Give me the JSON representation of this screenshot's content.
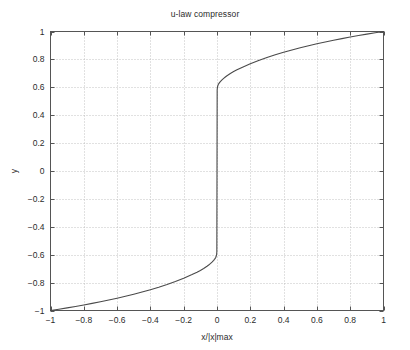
{
  "chart_data": {
    "type": "line",
    "title": "u-law compressor",
    "xlabel": "x/|x|max",
    "ylabel": "y",
    "xlim": [
      -1,
      1
    ],
    "ylim": [
      -1,
      1
    ],
    "grid": true,
    "legend": false,
    "mu": 255,
    "formula": "y = sign(x) * ln(1 + mu*|x|) / ln(1 + mu)",
    "line_color": "#4a4a4a",
    "grid_color": "#b4b4b4",
    "axis_color": "#555555",
    "background": "#ffffff",
    "xticks": [
      -1,
      -0.8,
      -0.6,
      -0.4,
      -0.2,
      0,
      0.2,
      0.4,
      0.6,
      0.8,
      1
    ],
    "xticklabels": [
      "-1",
      "-0.8",
      "-0.6",
      "-0.4",
      "-0.2",
      "0",
      "0.2",
      "0.4",
      "0.6",
      "0.8",
      "1"
    ],
    "yticks": [
      -1,
      -0.8,
      -0.6,
      -0.4,
      -0.2,
      0,
      0.2,
      0.4,
      0.6,
      0.8,
      1
    ],
    "yticklabels": [
      "-1",
      "-0.8",
      "-0.6",
      "-0.4",
      "-0.2",
      "0",
      "0.2",
      "0.4",
      "0.6",
      "0.8",
      "1"
    ],
    "x": [
      -1.0,
      -0.95,
      -0.9,
      -0.85,
      -0.8,
      -0.75,
      -0.7,
      -0.65,
      -0.6,
      -0.55,
      -0.5,
      -0.45,
      -0.4,
      -0.35,
      -0.3,
      -0.25,
      -0.2,
      -0.15,
      -0.12,
      -0.1,
      -0.08,
      -0.06,
      -0.05,
      -0.04,
      -0.03,
      -0.02,
      -0.015,
      -0.01,
      -0.007,
      -0.005,
      -0.003,
      -0.002,
      -0.001,
      0.0,
      0.001,
      0.002,
      0.003,
      0.005,
      0.007,
      0.01,
      0.015,
      0.02,
      0.03,
      0.04,
      0.05,
      0.06,
      0.08,
      0.1,
      0.12,
      0.15,
      0.2,
      0.25,
      0.3,
      0.35,
      0.4,
      0.45,
      0.5,
      0.55,
      0.6,
      0.65,
      0.7,
      0.75,
      0.8,
      0.85,
      0.9,
      0.95,
      1.0
    ],
    "y": [
      -1.0,
      -0.9907,
      -0.981,
      -0.9709,
      -0.9602,
      -0.9491,
      -0.9373,
      -0.925,
      -0.9119,
      -0.8981,
      -0.8834,
      -0.8678,
      -0.8511,
      -0.8331,
      -0.8136,
      -0.7924,
      -0.769,
      -0.7428,
      -0.7256,
      -0.7129,
      -0.6988,
      -0.6829,
      -0.674,
      -0.6643,
      -0.6534,
      -0.6407,
      -0.6334,
      -0.625,
      -0.6181,
      -0.6115,
      -0.6014,
      -0.5936,
      -0.5803,
      0.0,
      0.5803,
      0.5936,
      0.6014,
      0.6115,
      0.6181,
      0.625,
      0.6334,
      0.6407,
      0.6534,
      0.6643,
      0.674,
      0.6829,
      0.6988,
      0.7129,
      0.7256,
      0.7428,
      0.769,
      0.7924,
      0.8136,
      0.8331,
      0.8511,
      0.8678,
      0.8834,
      0.8981,
      0.9119,
      0.925,
      0.9373,
      0.9491,
      0.9602,
      0.9709,
      0.981,
      0.9907,
      1.0
    ]
  }
}
